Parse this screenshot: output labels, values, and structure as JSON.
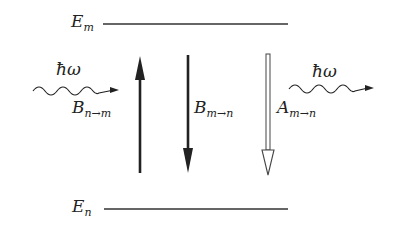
{
  "diagram": {
    "levels": {
      "upper": {
        "symbol": "E",
        "sub": "m"
      },
      "lower": {
        "symbol": "E",
        "sub": "n"
      }
    },
    "photons": {
      "incoming": {
        "label": "ħω"
      },
      "outgoing": {
        "label": "ħω"
      }
    },
    "transitions": [
      {
        "symbol": "B",
        "sub": "n→m",
        "direction": "up",
        "style": "solid"
      },
      {
        "symbol": "B",
        "sub": "m→n",
        "direction": "down",
        "style": "solid"
      },
      {
        "symbol": "A",
        "sub": "m→n",
        "direction": "down",
        "style": "hollow"
      }
    ],
    "colors": {
      "ink": "#222222",
      "background": "#ffffff"
    }
  }
}
